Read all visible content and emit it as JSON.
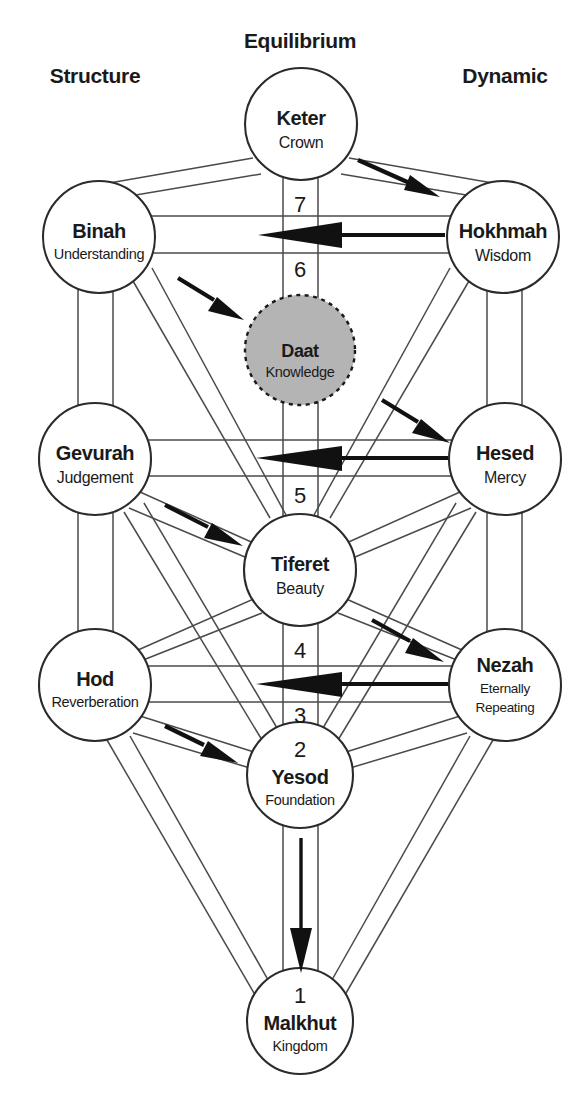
{
  "diagram": {
    "columns": [
      {
        "id": "structure",
        "label": "Structure"
      },
      {
        "id": "equilibrium",
        "label": "Equilibrium"
      },
      {
        "id": "dynamic",
        "label": "Dynamic"
      }
    ],
    "sephirot": [
      {
        "id": "keter",
        "name": "Keter",
        "translation": "Crown",
        "pillar": "equilibrium",
        "cx": 301,
        "cy": 124,
        "r": 56,
        "number": ""
      },
      {
        "id": "binah",
        "name": "Binah",
        "translation": "Understanding",
        "pillar": "structure",
        "cx": 99,
        "cy": 237,
        "r": 56,
        "number": ""
      },
      {
        "id": "hokhmah",
        "name": "Hokhmah",
        "translation": "Wisdom",
        "pillar": "dynamic",
        "cx": 503,
        "cy": 237,
        "r": 56,
        "number": ""
      },
      {
        "id": "daat",
        "name": "Daat",
        "translation": "Knowledge",
        "pillar": "equilibrium",
        "cx": 300,
        "cy": 350,
        "r": 55,
        "number": "",
        "hidden": true
      },
      {
        "id": "gevurah",
        "name": "Gevurah",
        "translation": "Judgement",
        "pillar": "structure",
        "cx": 95,
        "cy": 459,
        "r": 56,
        "number": ""
      },
      {
        "id": "hesed",
        "name": "Hesed",
        "translation": "Mercy",
        "pillar": "dynamic",
        "cx": 505,
        "cy": 459,
        "r": 56,
        "number": ""
      },
      {
        "id": "tiferet",
        "name": "Tiferet",
        "translation": "Beauty",
        "pillar": "equilibrium",
        "cx": 300,
        "cy": 570,
        "r": 56,
        "number": ""
      },
      {
        "id": "hod",
        "name": "Hod",
        "translation": "Reverberation",
        "pillar": "structure",
        "cx": 95,
        "cy": 685,
        "r": 56,
        "number": ""
      },
      {
        "id": "nezah",
        "name": "Nezah",
        "translation": "Eternally Repeating",
        "pillar": "dynamic",
        "cx": 505,
        "cy": 685,
        "r": 56,
        "number": ""
      },
      {
        "id": "yesod",
        "name": "Yesod",
        "translation": "Foundation",
        "pillar": "equilibrium",
        "cx": 300,
        "cy": 775,
        "r": 53,
        "number": "2"
      },
      {
        "id": "malkhut",
        "name": "Malkhut",
        "translation": "Kingdom",
        "pillar": "equilibrium",
        "cx": 300,
        "cy": 1021,
        "r": 53,
        "number": "1"
      }
    ],
    "path_numbers": [
      {
        "id": "path-7",
        "label": "7",
        "x": 300,
        "y": 212
      },
      {
        "id": "path-6",
        "label": "6",
        "x": 300,
        "y": 277
      },
      {
        "id": "path-5",
        "label": "5",
        "x": 300,
        "y": 503
      },
      {
        "id": "path-4",
        "label": "4",
        "x": 300,
        "y": 658
      },
      {
        "id": "path-3",
        "label": "3",
        "x": 300,
        "y": 723
      }
    ],
    "flow_arrows": [
      {
        "id": "arrow-keter-to-hokhmah",
        "direction": "down-right",
        "from": "keter",
        "to": "hokhmah"
      },
      {
        "id": "arrow-hokhmah-to-binah",
        "direction": "left",
        "from": "hokhmah",
        "to": "binah"
      },
      {
        "id": "arrow-binah-to-daat",
        "direction": "down-right",
        "from": "binah",
        "to": "daat"
      },
      {
        "id": "arrow-daat-to-hesed",
        "direction": "down-right",
        "from": "daat",
        "to": "hesed"
      },
      {
        "id": "arrow-hesed-to-gevurah",
        "direction": "left",
        "from": "hesed",
        "to": "gevurah"
      },
      {
        "id": "arrow-gevurah-to-tiferet",
        "direction": "down-right",
        "from": "gevurah",
        "to": "tiferet"
      },
      {
        "id": "arrow-tiferet-to-nezah",
        "direction": "down-right",
        "from": "tiferet",
        "to": "nezah"
      },
      {
        "id": "arrow-nezah-to-hod",
        "direction": "left",
        "from": "nezah",
        "to": "hod"
      },
      {
        "id": "arrow-hod-to-yesod",
        "direction": "down-right",
        "from": "hod",
        "to": "yesod"
      },
      {
        "id": "arrow-yesod-to-malkhut",
        "direction": "down",
        "from": "yesod",
        "to": "malkhut"
      }
    ],
    "colors": {
      "background": "#ffffff",
      "ink": "#1a1a1a",
      "channel_stroke": "#4a4a4a",
      "circle_stroke": "#2b2b2b",
      "daat_fill": "#b4b4b4",
      "arrow_fill": "#111111"
    }
  }
}
